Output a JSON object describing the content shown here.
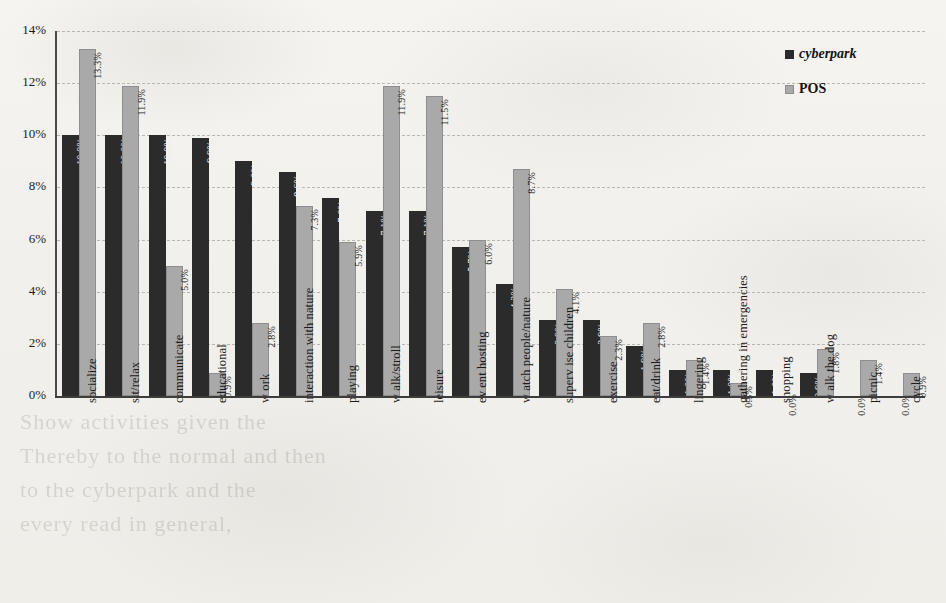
{
  "chart_data": {
    "type": "bar",
    "title": "",
    "xlabel": "",
    "ylabel": "",
    "ylim": [
      0,
      14
    ],
    "ytick_labels": [
      "0%",
      "2%",
      "4%",
      "6%",
      "8%",
      "10%",
      "12%",
      "14%"
    ],
    "ytick_values": [
      0,
      2,
      4,
      6,
      8,
      10,
      12,
      14
    ],
    "grid": true,
    "legend_position": "top-right",
    "value_suffix": "%",
    "categories": [
      "socialize",
      "sit/relax",
      "communicate",
      "educational",
      "w ork",
      "interaction with nature",
      "playing",
      "w alk/stroll",
      "leisure",
      "ev ent hosting",
      "w atch people/nature",
      "superv ise children",
      "exercise",
      "eat/drink",
      "lingering",
      "gathering in emergencies",
      "shopping",
      "w alk the dog",
      "picnic",
      "cycle"
    ],
    "series": [
      {
        "name": "cyberpark",
        "color": "#2b2b2b",
        "values": [
          10.0,
          10.0,
          10.0,
          9.9,
          9.0,
          8.6,
          7.6,
          7.1,
          7.1,
          5.7,
          4.3,
          2.9,
          2.9,
          1.9,
          1.0,
          1.0,
          1.0,
          0.9,
          0.0,
          0.0
        ],
        "labels": [
          "10.0%",
          "10.0%",
          "10.0%",
          "9.9%",
          "9.0%",
          "8.6%",
          "7.6%",
          "7.1%",
          "7.1%",
          "5.7%",
          "4.3%",
          "2.9%",
          "2.9%",
          "1.9%",
          "1.0%",
          "1.0%",
          "1.0%",
          "0.9%",
          "0.0%",
          "0.0%"
        ]
      },
      {
        "name": "POS",
        "color": "#a9a9a9",
        "values": [
          13.3,
          11.9,
          5.0,
          0.9,
          2.8,
          7.3,
          5.9,
          11.9,
          11.5,
          6.0,
          8.7,
          4.1,
          2.3,
          2.8,
          1.4,
          0.5,
          0.0,
          1.8,
          1.4,
          0.9
        ],
        "labels": [
          "13.3%",
          "11.9%",
          "5.0%",
          "0.9%",
          "2.8%",
          "7.3%",
          "5.9%",
          "11.9%",
          "11.5%",
          "6.0%",
          "8.7%",
          "4.1%",
          "2.3%",
          "2.8%",
          "1.4%",
          "0.5%",
          "0.0%",
          "1.8%",
          "1.4%",
          "0.9%"
        ]
      }
    ]
  },
  "legend": {
    "items": [
      {
        "label": "cyberpark",
        "style": "italic"
      },
      {
        "label": "POS",
        "style": "plain"
      }
    ]
  },
  "background_ghost_lines": [
    "Show  activities  given  the",
    "Thereby  to  the  normal  and  then",
    "to  the  cyberpark  and  the",
    "every  read  in  general,"
  ]
}
